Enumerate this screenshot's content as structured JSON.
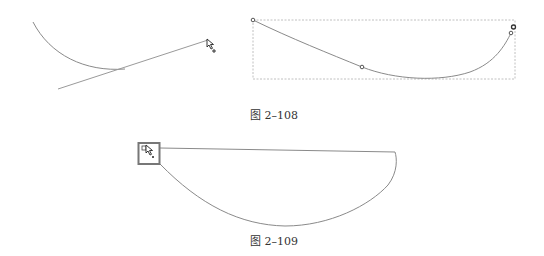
{
  "figures": [
    {
      "id": "fig1",
      "caption": "图 2–108",
      "panels": [
        {
          "name": "curve-with-tangent-handle",
          "description": "Curve segment with a tangent control line being dragged by the pointer"
        },
        {
          "name": "curve-in-bounding-box",
          "description": "Edited curve shown inside a dashed bounding box with node handles"
        }
      ]
    },
    {
      "id": "fig2",
      "caption": "图 2–109",
      "panels": [
        {
          "name": "closing-curve-at-start-node",
          "description": "Pointer over the start node highlighted with a square, closing the path"
        }
      ]
    }
  ],
  "colors": {
    "stroke": "#8a8a8a",
    "dashed_box": "#b0b0b0",
    "node": "#555555",
    "highlight_square": "#777777",
    "cursor": "#222222"
  }
}
